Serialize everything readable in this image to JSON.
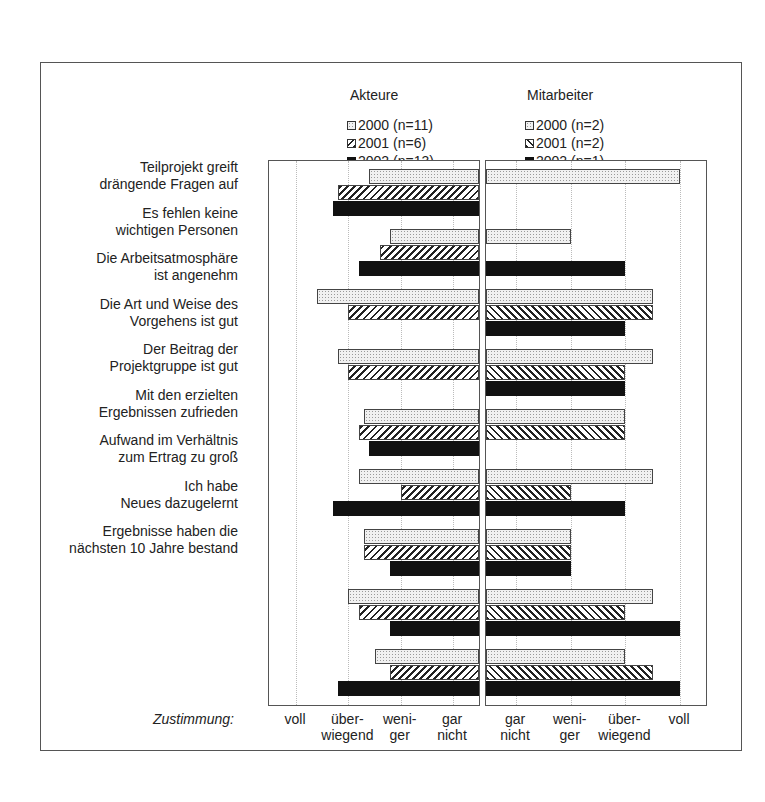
{
  "chart_data": {
    "type": "bar",
    "orientation": "horizontal",
    "title": "",
    "panels": [
      {
        "name": "Akteure",
        "direction": "leftward",
        "legend": [
          "2000 (n=11)",
          "2001 (n=6)",
          "2002 (n=13)"
        ]
      },
      {
        "name": "Mitarbeiter",
        "direction": "rightward",
        "legend": [
          "2000 (n=2)",
          "2001 (n=2)",
          "2002 (n=1)"
        ]
      }
    ],
    "scale": {
      "1": "gar nicht",
      "2": "weniger",
      "3": "überwiegend",
      "4": "voll"
    },
    "xlabel": "Zustimmung:",
    "categories": [
      "Teilprojekt greift drängende Fragen auf",
      "Es fehlen keine wichtigen Personen",
      "Die Arbeitsatmosphäre ist angenehm",
      "Die Art und Weise des Vorgehens ist gut",
      "Der Beitrag der Projektgruppe ist gut",
      "Mit den erzielten Ergebnissen zufrieden",
      "Aufwand im Verhältnis zum Ertrag zu groß",
      "Ich habe Neues dazugelernt",
      "Ergebnisse haben die nächsten 10 Jahre bestand"
    ],
    "series": [
      {
        "name": "Akteure 2000 (n=11)",
        "values": [
          2.6,
          2.2,
          3.6,
          3.2,
          2.7,
          2.8,
          2.7,
          3.0,
          2.5
        ]
      },
      {
        "name": "Akteure 2001 (n=6)",
        "values": [
          3.2,
          2.4,
          3.0,
          3.0,
          2.8,
          2.0,
          2.7,
          2.8,
          2.2
        ]
      },
      {
        "name": "Akteure 2002 (n=13)",
        "values": [
          3.3,
          2.8,
          null,
          null,
          2.6,
          3.3,
          2.2,
          2.2,
          3.2
        ]
      },
      {
        "name": "Mitarbeiter 2000 (n=2)",
        "values": [
          4.0,
          2.0,
          3.5,
          3.5,
          3.0,
          3.5,
          2.0,
          3.5,
          3.0
        ]
      },
      {
        "name": "Mitarbeiter 2001 (n=2)",
        "values": [
          null,
          null,
          3.5,
          3.0,
          3.0,
          2.0,
          2.0,
          3.0,
          3.5
        ]
      },
      {
        "name": "Mitarbeiter 2002 (n=1)",
        "values": [
          null,
          3.0,
          3.0,
          3.0,
          null,
          3.0,
          2.0,
          4.0,
          4.0
        ]
      }
    ],
    "xlim": [
      0.5,
      4.5
    ],
    "grid": true,
    "legend_position": "top"
  },
  "labels": {
    "akteure": "Akteure",
    "mitarbeiter": "Mitarbeiter",
    "zustimmung": "Zustimmung:",
    "legend_left": [
      "2000 (n=11)",
      "2001 (n=6)",
      "2002 (n=13)"
    ],
    "legend_right": [
      "2000 (n=2)",
      "2001 (n=2)",
      "2002 (n=1)"
    ],
    "cat_lines": [
      [
        "Teilprojekt greift",
        "drängende Fragen auf"
      ],
      [
        "Es fehlen keine",
        "wichtigen Personen"
      ],
      [
        "Die Arbeitsatmosphäre",
        "ist angenehm"
      ],
      [
        "Die Art und Weise des",
        "Vorgehens ist gut"
      ],
      [
        "Der Beitrag der",
        "Projektgruppe ist gut"
      ],
      [
        "Mit den erzielten",
        "Ergebnissen zufrieden"
      ],
      [
        "Aufwand im Verhältnis",
        "zum Ertrag zu groß"
      ],
      [
        "Ich habe",
        "Neues dazugelernt"
      ],
      [
        "Ergebnisse haben die",
        "nächsten 10 Jahre bestand"
      ]
    ],
    "ticks_left": [
      [
        "voll",
        ""
      ],
      [
        "über-",
        "wiegend"
      ],
      [
        "weni-",
        "ger"
      ],
      [
        "gar",
        "nicht"
      ]
    ],
    "ticks_right": [
      [
        "gar",
        "nicht"
      ],
      [
        "weni-",
        "ger"
      ],
      [
        "über-",
        "wiegend"
      ],
      [
        "voll",
        ""
      ]
    ]
  }
}
